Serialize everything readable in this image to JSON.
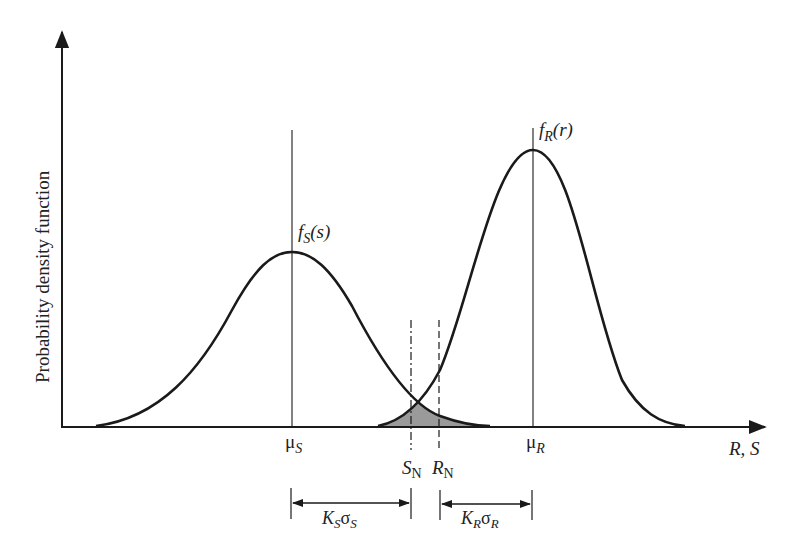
{
  "diagram": {
    "y_axis_label": "Probability density function",
    "x_axis_label": "R, S",
    "curves": [
      {
        "name": "stress",
        "label_f": "f",
        "label_sub": "S",
        "label_arg": "(s)",
        "mean_label": "μ",
        "mean_sub": "S"
      },
      {
        "name": "strength",
        "label_f": "f",
        "label_sub": "R",
        "label_arg": "(r)",
        "mean_label": "μ",
        "mean_sub": "R"
      }
    ],
    "nominal_lines": [
      {
        "name": "S_N",
        "label": "S",
        "sub": "N",
        "style": "dash-dot"
      },
      {
        "name": "R_N",
        "label": "R",
        "sub": "N",
        "style": "dashed"
      }
    ],
    "intervals": [
      {
        "name": "KS_sigmaS",
        "k": "K",
        "k_sub": "S",
        "sigma": "σ",
        "sigma_sub": "S"
      },
      {
        "name": "KR_sigmaR",
        "k": "K",
        "k_sub": "R",
        "sigma": "σ",
        "sigma_sub": "R"
      }
    ],
    "overlap_fill_color": "#9a9a9a",
    "line_color": "#1a1a1a"
  }
}
